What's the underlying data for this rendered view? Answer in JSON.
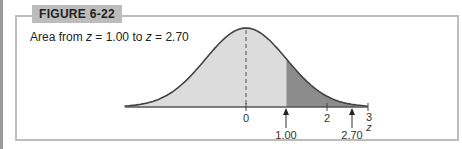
{
  "figure": {
    "label": "FIGURE 6-22",
    "caption_prefix": "Area from ",
    "caption_var1": "z",
    "caption_mid": " = 1.00 to ",
    "caption_var2": "z",
    "caption_end": " = 2.70"
  },
  "chart_data": {
    "type": "area",
    "title": "Area from z = 1.00 to z = 2.70",
    "xlabel": "z",
    "ylabel": "",
    "xlim": [
      -3,
      3
    ],
    "distribution": "standard normal",
    "shaded_region": {
      "from": 1.0,
      "to": 2.7,
      "color": "#8c8c8c"
    },
    "base_fill_color": "#dcdcdc",
    "tick_labels": [
      "0",
      "2",
      "3"
    ],
    "arrow_labels": [
      "1.00",
      "2.70"
    ],
    "mean_line": {
      "x": 0,
      "style": "dashed"
    },
    "grid": false,
    "legend": null
  }
}
